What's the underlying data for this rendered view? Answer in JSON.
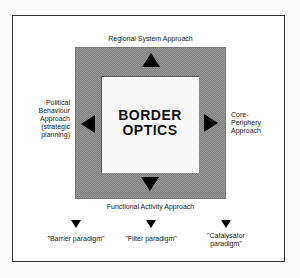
{
  "diagram": {
    "center_title_line1": "BORDER",
    "center_title_line2": "OPTICS",
    "top_label": "Regional System Approach",
    "bottom_label": "Functional Activity Approach",
    "left_label": [
      "Political",
      "Behaviour",
      "Approach",
      "(strategic",
      "planning)"
    ],
    "right_label": [
      "Core-",
      "Periphery",
      "Approach"
    ],
    "paradigms": [
      {
        "label_lines": [
          "\"Barrier paradigm\""
        ]
      },
      {
        "label_lines": [
          "\"Filter paradigm\""
        ]
      },
      {
        "label_lines": [
          "\"Catalysator",
          "paradigm\""
        ]
      }
    ],
    "colors": {
      "frame": "#333333",
      "gray_band": "#8c8c8c",
      "inner": "#f7f7f7",
      "arrows": "#000000"
    }
  }
}
